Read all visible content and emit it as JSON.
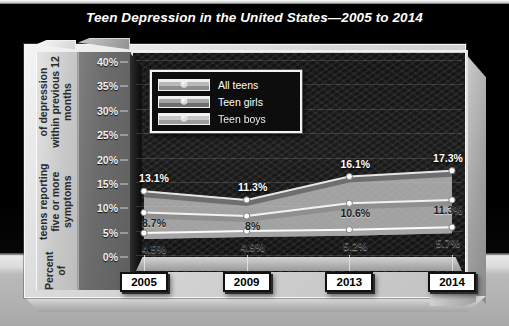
{
  "chart_data": {
    "type": "line",
    "title": "Teen Depression in the United States—2005 to 2014",
    "xlabel": "",
    "ylabel": "Percent of teens reporting five or more symptoms of depression within previous 12 months",
    "ylabel_line1": "Percent of",
    "ylabel_line2": "teens reporting five or more symptoms",
    "ylabel_line3": "of depression within previous 12 months",
    "categories": [
      "2005",
      "2009",
      "2013",
      "2014"
    ],
    "ylim": [
      0,
      40
    ],
    "ytick_labels": [
      "0%",
      "5%",
      "10%",
      "15%",
      "20%",
      "25%",
      "30%",
      "35%",
      "40%"
    ],
    "ytick_values": [
      0,
      5,
      10,
      15,
      20,
      25,
      30,
      35,
      40
    ],
    "grid": true,
    "legend_position": "top-left-inside",
    "series": [
      {
        "name": "All teens",
        "values": [
          8.7,
          8.0,
          10.6,
          11.3
        ],
        "labels": [
          "8.7%",
          "8%",
          "10.6%",
          "11.3%"
        ]
      },
      {
        "name": "Teen girls",
        "values": [
          13.1,
          11.3,
          16.1,
          17.3
        ],
        "labels": [
          "13.1%",
          "11.3%",
          "16.1%",
          "17.3%"
        ]
      },
      {
        "name": "Teen boys",
        "values": [
          4.5,
          4.9,
          5.2,
          5.7
        ],
        "labels": [
          "4.5%",
          "4.9%",
          "5.2%",
          "5.7%"
        ]
      }
    ]
  },
  "legend": {
    "items": [
      {
        "label": "All teens"
      },
      {
        "label": "Teen girls"
      },
      {
        "label": "Teen boys"
      }
    ]
  },
  "colors": {
    "background": "#000000",
    "floor": "#b9b9b9",
    "plot_background": "#171717",
    "title_text": "#ffffff",
    "axis_text": "#f2f2f2",
    "plaque_fill": "#ffffff",
    "plaque_border": "#111111"
  }
}
